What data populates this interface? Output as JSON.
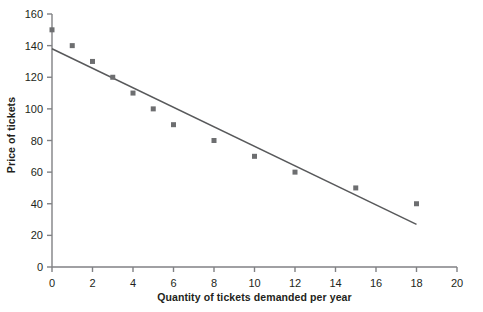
{
  "chart_data": {
    "type": "scatter",
    "title": "",
    "subtitle": "",
    "xlabel": "Quantity of tickets demanded per year",
    "ylabel": "Price of tickets",
    "xlim": [
      0,
      20
    ],
    "ylim": [
      0,
      160
    ],
    "xticks": [
      0,
      2,
      4,
      6,
      8,
      10,
      12,
      14,
      16,
      18,
      20
    ],
    "yticks": [
      0,
      20,
      40,
      60,
      80,
      100,
      120,
      140,
      160
    ],
    "xtick_labels": [
      "0",
      "2",
      "4",
      "6",
      "8",
      "10",
      "12",
      "14",
      "16",
      "18",
      "20"
    ],
    "ytick_labels": [
      "0",
      "20",
      "40",
      "60",
      "80",
      "100",
      "120",
      "140",
      "160"
    ],
    "grid": false,
    "legend": null,
    "legend_position": "none",
    "marker": "square",
    "marker_color": "#6d6e70",
    "line_color": "#58595b",
    "axis_color": "#808184",
    "series": [
      {
        "name": "Observed demand",
        "type": "scatter",
        "x": [
          0,
          1,
          2,
          3,
          4,
          5,
          6,
          8,
          10,
          12,
          15,
          18
        ],
        "y": [
          150,
          140,
          130,
          120,
          110,
          100,
          90,
          80,
          70,
          60,
          50,
          40
        ],
        "points": [
          {
            "x": 0,
            "y": 150
          },
          {
            "x": 1,
            "y": 140
          },
          {
            "x": 2,
            "y": 130
          },
          {
            "x": 3,
            "y": 120
          },
          {
            "x": 4,
            "y": 110
          },
          {
            "x": 5,
            "y": 100
          },
          {
            "x": 6,
            "y": 90
          },
          {
            "x": 8,
            "y": 80
          },
          {
            "x": 10,
            "y": 70
          },
          {
            "x": 12,
            "y": 60
          },
          {
            "x": 15,
            "y": 50
          },
          {
            "x": 18,
            "y": 40
          }
        ]
      },
      {
        "name": "Fitted demand line",
        "type": "line",
        "x": [
          0,
          18
        ],
        "y": [
          138,
          27
        ]
      }
    ],
    "annotations": []
  }
}
